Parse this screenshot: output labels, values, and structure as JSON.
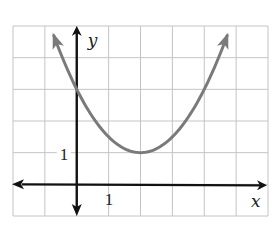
{
  "chart_data": {
    "type": "line",
    "title": "",
    "xlabel": "x",
    "ylabel": "y",
    "xlim": [
      -2,
      6
    ],
    "ylim": [
      -1,
      5
    ],
    "grid": true,
    "grid_step": 1,
    "tick_labels": {
      "x": [
        {
          "value": 1,
          "label": "1"
        }
      ],
      "y": [
        {
          "value": 1,
          "label": "1"
        }
      ]
    },
    "series": [
      {
        "name": "parabola",
        "equation": "y = 0.5(x - 2)^2 + 1",
        "vertex": [
          2,
          1
        ],
        "y_intercept": 3,
        "x_domain_shown": [
          -0.72,
          4.72
        ],
        "arrows_at_ends": true,
        "color": "#7a7a7a",
        "x": [
          -0.72,
          -0.5,
          0,
          0.5,
          1,
          1.5,
          2,
          2.5,
          3,
          3.5,
          4,
          4.5,
          4.72
        ],
        "values": [
          4.7,
          4.125,
          3,
          2.125,
          1.5,
          1.125,
          1,
          1.125,
          1.5,
          2.125,
          3,
          4.125,
          4.7
        ]
      }
    ],
    "axis_color": "#111111",
    "grid_color": "#c4c4c4"
  }
}
